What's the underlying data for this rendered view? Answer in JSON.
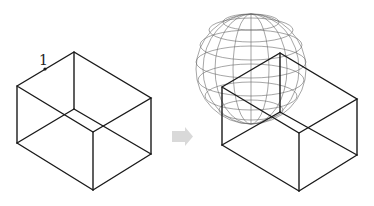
{
  "figure": {
    "left_panel": {
      "label": "1",
      "box": {
        "top_left": [
          17,
          86
        ],
        "top_back": [
          74,
          52
        ],
        "top_right": [
          151,
          98
        ],
        "top_front": [
          93,
          132
        ],
        "bottom_left": [
          17,
          143
        ],
        "bottom_back": [
          74,
          109
        ],
        "bottom_right": [
          151,
          154
        ],
        "bottom_front": [
          93,
          190
        ]
      },
      "marker_point": [
        45,
        69
      ]
    },
    "arrow": {
      "color": "#d9d9d9",
      "direction": "right"
    },
    "right_panel": {
      "box": {
        "top_left": [
          222,
          87
        ],
        "top_back": [
          280,
          53
        ],
        "top_right": [
          357,
          99
        ],
        "top_front": [
          299,
          133
        ],
        "bottom_left": [
          222,
          145
        ],
        "bottom_back": [
          280,
          112
        ],
        "bottom_right": [
          357,
          155
        ],
        "bottom_front": [
          299,
          191
        ]
      },
      "sphere": {
        "center": [
          251,
          69
        ],
        "radius": 55,
        "style": "wireframe"
      }
    }
  }
}
